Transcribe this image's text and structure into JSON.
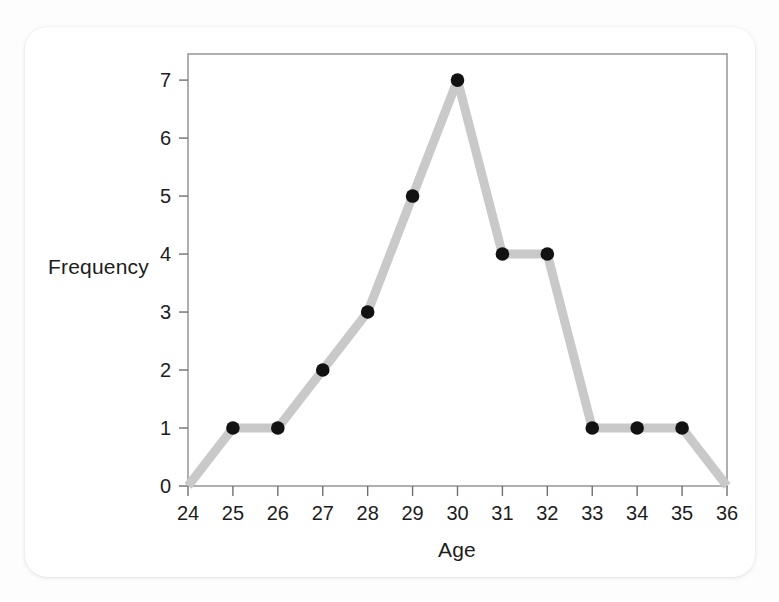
{
  "card": {
    "background": "#ffffff",
    "corner_radius_px": 22
  },
  "chart_data": {
    "type": "line",
    "title": "",
    "subtitle": "",
    "xlabel": "Age",
    "ylabel": "Frequency",
    "x": [
      24,
      25,
      26,
      27,
      28,
      29,
      30,
      31,
      32,
      33,
      34,
      35,
      36
    ],
    "values": [
      0,
      1,
      1,
      2,
      3,
      5,
      7,
      4,
      4,
      1,
      1,
      1,
      0
    ],
    "series": [
      {
        "name": "Frequency",
        "values": [
          0,
          1,
          1,
          2,
          3,
          5,
          7,
          4,
          4,
          1,
          1,
          1,
          0
        ]
      }
    ],
    "points": [
      {
        "x": 24,
        "y": 0,
        "marker": false
      },
      {
        "x": 25,
        "y": 1,
        "marker": true
      },
      {
        "x": 26,
        "y": 1,
        "marker": true
      },
      {
        "x": 27,
        "y": 2,
        "marker": true
      },
      {
        "x": 28,
        "y": 3,
        "marker": true
      },
      {
        "x": 29,
        "y": 5,
        "marker": true
      },
      {
        "x": 30,
        "y": 7,
        "marker": true
      },
      {
        "x": 31,
        "y": 4,
        "marker": true
      },
      {
        "x": 32,
        "y": 4,
        "marker": true
      },
      {
        "x": 33,
        "y": 1,
        "marker": true
      },
      {
        "x": 34,
        "y": 1,
        "marker": true
      },
      {
        "x": 35,
        "y": 1,
        "marker": true
      },
      {
        "x": 36,
        "y": 0,
        "marker": false
      }
    ],
    "xlim": [
      24,
      36
    ],
    "ylim": [
      0,
      7.45
    ],
    "xticks": [
      24,
      25,
      26,
      27,
      28,
      29,
      30,
      31,
      32,
      33,
      34,
      35,
      36
    ],
    "yticks": [
      0,
      1,
      2,
      3,
      4,
      5,
      6,
      7
    ],
    "xtick_labels": [
      "24",
      "25",
      "26",
      "27",
      "28",
      "29",
      "30",
      "31",
      "32",
      "33",
      "34",
      "35",
      "36"
    ],
    "ytick_labels": [
      "0",
      "1",
      "2",
      "3",
      "4",
      "5",
      "6",
      "7"
    ],
    "grid": false,
    "legend": null,
    "legend_position": "none",
    "annotations": [],
    "style": {
      "line_color": "#c9c9c9",
      "line_width_px": 9,
      "marker_color": "#121212",
      "marker_radius_px": 6.8,
      "frame_color": "#8d8d8d",
      "tick_color": "#6f6f6f",
      "text_color": "#1d1d1d",
      "plot_background": "#ffffff"
    },
    "geometry": {
      "plot_left_px": 188,
      "plot_right_px": 727,
      "plot_top_px": 54,
      "plot_bottom_px": 486
    }
  }
}
